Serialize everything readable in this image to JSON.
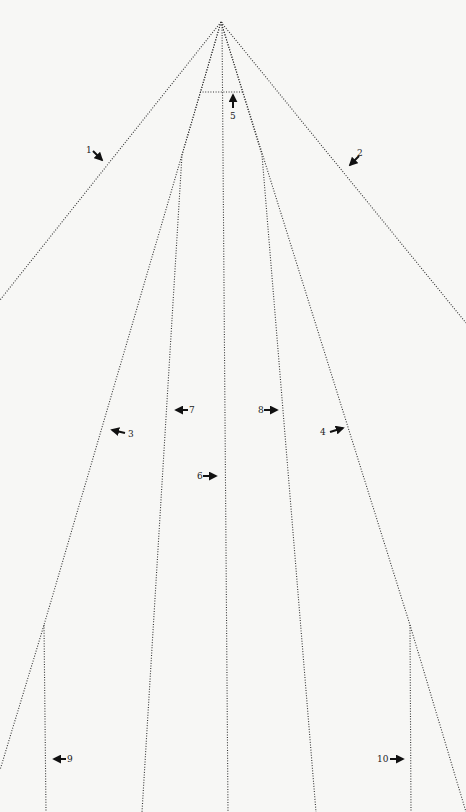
{
  "diagram": {
    "type": "pattern-layout",
    "background": "#f7f7f5",
    "line_color": "#333333",
    "apex": {
      "x": 221,
      "y": 22
    },
    "lines": [
      {
        "id": "1",
        "points": [
          [
            221,
            22
          ],
          [
            0,
            300
          ]
        ]
      },
      {
        "id": "2",
        "points": [
          [
            221,
            22
          ],
          [
            466,
            323
          ]
        ]
      },
      {
        "id": "3",
        "points": [
          [
            221,
            22
          ],
          [
            44,
            625
          ],
          [
            0,
            770
          ]
        ]
      },
      {
        "id": "4",
        "points": [
          [
            221,
            22
          ],
          [
            410,
            625
          ],
          [
            466,
            812
          ]
        ]
      },
      {
        "id": "5",
        "points": [
          [
            200,
            92
          ],
          [
            244,
            92
          ]
        ]
      },
      {
        "id": "6",
        "points": [
          [
            222,
            22
          ],
          [
            228,
            812
          ]
        ]
      },
      {
        "id": "7",
        "points": [
          [
            221,
            22
          ],
          [
            182,
            155
          ],
          [
            142,
            812
          ]
        ]
      },
      {
        "id": "8",
        "points": [
          [
            221,
            22
          ],
          [
            262,
            155
          ],
          [
            316,
            812
          ]
        ]
      },
      {
        "id": "9",
        "points": [
          [
            44,
            625
          ],
          [
            46,
            812
          ]
        ]
      },
      {
        "id": "10",
        "points": [
          [
            410,
            625
          ],
          [
            411,
            812
          ]
        ]
      }
    ],
    "callouts": [
      {
        "label": "1",
        "text_x": 86,
        "text_y": 145,
        "arrow": {
          "x1": 93,
          "y1": 151,
          "x2": 102,
          "y2": 160
        }
      },
      {
        "label": "2",
        "text_x": 357,
        "text_y": 148,
        "arrow": {
          "x1": 359,
          "y1": 156,
          "x2": 350,
          "y2": 165
        }
      },
      {
        "label": "3",
        "text_x": 128,
        "text_y": 429,
        "arrow": {
          "x1": 125,
          "y1": 433,
          "x2": 112,
          "y2": 430
        }
      },
      {
        "label": "4",
        "text_x": 320,
        "text_y": 427,
        "arrow": {
          "x1": 330,
          "y1": 432,
          "x2": 343,
          "y2": 428
        }
      },
      {
        "label": "5",
        "text_x": 230,
        "text_y": 111,
        "arrow": {
          "x1": 233,
          "y1": 108,
          "x2": 233,
          "y2": 95
        }
      },
      {
        "label": "6",
        "text_x": 197,
        "text_y": 471,
        "arrow": {
          "x1": 203,
          "y1": 476,
          "x2": 216,
          "y2": 476
        }
      },
      {
        "label": "7",
        "text_x": 189,
        "text_y": 405,
        "arrow": {
          "x1": 188,
          "y1": 410,
          "x2": 176,
          "y2": 410
        }
      },
      {
        "label": "8",
        "text_x": 258,
        "text_y": 405,
        "arrow": {
          "x1": 264,
          "y1": 410,
          "x2": 277,
          "y2": 410
        }
      },
      {
        "label": "9",
        "text_x": 67,
        "text_y": 754,
        "arrow": {
          "x1": 66,
          "y1": 759,
          "x2": 54,
          "y2": 759
        }
      },
      {
        "label": "10",
        "text_x": 377,
        "text_y": 754,
        "arrow": {
          "x1": 390,
          "y1": 759,
          "x2": 403,
          "y2": 759
        }
      }
    ]
  }
}
